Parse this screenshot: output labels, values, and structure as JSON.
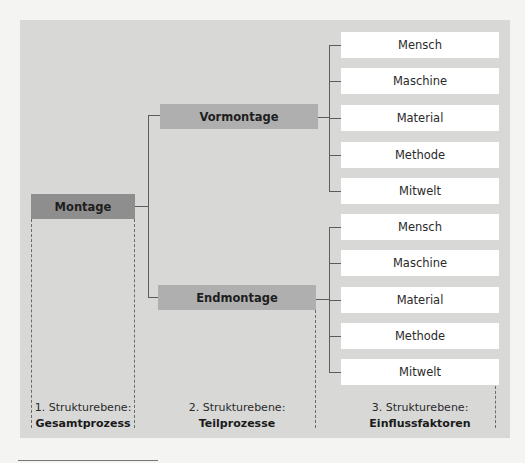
{
  "diagram": {
    "level1": {
      "root": "Montage"
    },
    "level2": {
      "nodes": [
        "Vormontage",
        "Endmontage"
      ]
    },
    "level3": {
      "vormontage_factors": [
        "Mensch",
        "Maschine",
        "Material",
        "Methode",
        "Mitwelt"
      ],
      "endmontage_factors": [
        "Mensch",
        "Maschine",
        "Material",
        "Methode",
        "Mitwelt"
      ]
    },
    "column_labels": [
      {
        "line1": "1. Strukturebene:",
        "line2": "Gesamtprozess"
      },
      {
        "line1": "2. Strukturebene:",
        "line2": "Teilprozesse"
      },
      {
        "line1": "3. Strukturebene:",
        "line2": "Einflussfaktoren"
      }
    ],
    "colors": {
      "panel": "#d8d8d7",
      "root_box": "#8e8e8e",
      "mid_box": "#afafaf",
      "leaf_box": "#ffffff",
      "connector": "#5c5c5c"
    }
  }
}
